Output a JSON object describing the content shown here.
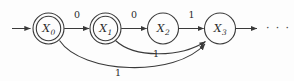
{
  "diagram": {
    "type": "finite-state-automaton",
    "title": "",
    "canvas": {
      "width": 294,
      "height": 81,
      "background": "#fdfdfd"
    },
    "stroke_color": "#3a3a3a",
    "text_color": "#2a2a2a",
    "states": [
      {
        "id": "X0",
        "label_base": "X",
        "label_sub": "0",
        "accepting": true,
        "cx": 48.5,
        "cy": 28.5,
        "r": 15.5,
        "r_inner": 12.2
      },
      {
        "id": "X1",
        "label_base": "X",
        "label_sub": "1",
        "accepting": true,
        "cx": 105.5,
        "cy": 28.5,
        "r": 15.5,
        "r_inner": 12.2
      },
      {
        "id": "X2",
        "label_base": "X",
        "label_sub": "2",
        "accepting": false,
        "cx": 163.0,
        "cy": 28.5,
        "r": 15.5,
        "r_inner": 0
      },
      {
        "id": "X3",
        "label_base": "X",
        "label_sub": "3",
        "accepting": false,
        "cx": 220.0,
        "cy": 28.5,
        "r": 15.5,
        "r_inner": 0
      }
    ],
    "start_arrow": {
      "from_x": 12,
      "to_x": 31,
      "y": 28.5
    },
    "exit_arrow": {
      "from_x": 236,
      "to_x": 258,
      "y": 28.5
    },
    "transitions": [
      {
        "id": "t0",
        "from": "X0",
        "to": "X1",
        "symbol": "0",
        "shape": "straight",
        "label_x": 77,
        "label_y": 18
      },
      {
        "id": "t1",
        "from": "X1",
        "to": "X2",
        "symbol": "0",
        "shape": "straight",
        "label_x": 134,
        "label_y": 18
      },
      {
        "id": "t2",
        "from": "X2",
        "to": "X3",
        "symbol": "1",
        "shape": "straight",
        "label_x": 191.5,
        "label_y": 18
      },
      {
        "id": "t3",
        "from": "X1",
        "to": "X3",
        "symbol": "1",
        "shape": "curve-short",
        "label_x": 156,
        "label_y": 55
      },
      {
        "id": "t4",
        "from": "X0",
        "to": "X3",
        "symbol": "1",
        "shape": "curve-long",
        "label_x": 118,
        "label_y": 74
      }
    ],
    "continuation": {
      "text": "· · ·",
      "x": 272,
      "y": 32
    }
  }
}
